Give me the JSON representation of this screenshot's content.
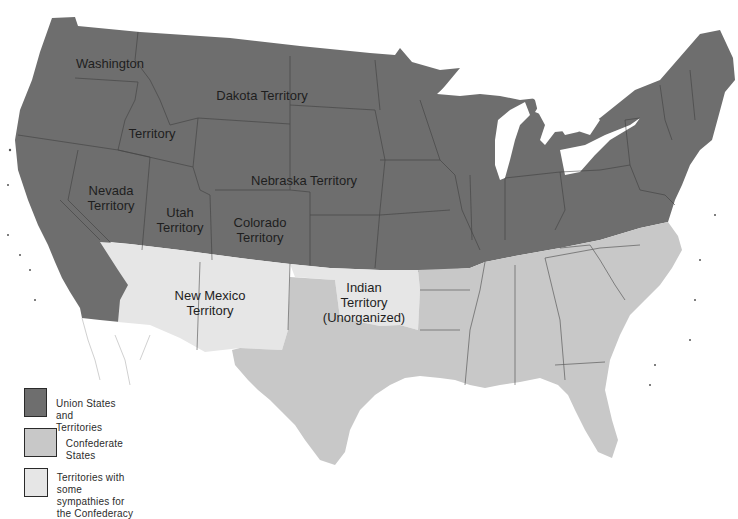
{
  "colors": {
    "union": "#6e6e6e",
    "confederate": "#c8c8c8",
    "sympathetic": "#e6e6e6",
    "border": "#3a3a3a",
    "water": "#ffffff"
  },
  "labels": {
    "washington": "Washington",
    "idaho_territory": "Territory",
    "dakota": "Dakota Territory",
    "nebraska": "Nebraska Territory",
    "nevada": "Nevada\nTerritory",
    "utah": "Utah\nTerritory",
    "colorado": "Colorado\nTerritory",
    "new_mexico": "New Mexico\nTerritory",
    "indian": "Indian\nTerritory\n(Unorganized)"
  },
  "legend": {
    "items": [
      {
        "label": "Union States and Territories",
        "category": "union"
      },
      {
        "label": "Confederate States",
        "category": "confederate"
      },
      {
        "label": "Territories with some\nsympathies for the Confederacy",
        "category": "sympathetic"
      }
    ]
  }
}
